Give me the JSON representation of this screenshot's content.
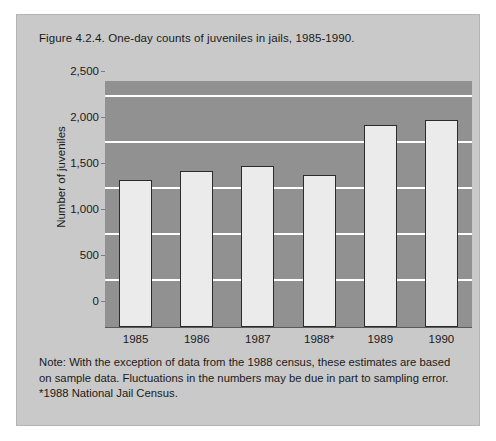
{
  "figure": {
    "title": "Figure 4.2.4. One-day counts of juveniles in jails, 1985-1990.",
    "note": "Note: With the exception of data from the 1988 census, these estimates are based on sample data. Fluctuations in the numbers may be due in part to sampling error. *1988 National Jail Census."
  },
  "colors": {
    "page_background": "#ffffff",
    "card_background": "#c9c9c9",
    "plot_background": "#919191",
    "gridline": "#ffffff",
    "bar_fill": "#ebebeb",
    "bar_outline": "#2b2b2b",
    "text": "#1a1a1a"
  },
  "chart_data": {
    "type": "bar",
    "title": "Figure 4.2.4. One-day counts of juveniles in jails, 1985-1990.",
    "xlabel": "",
    "ylabel": "Number of juveniles",
    "categories": [
      "1985",
      "1986",
      "1987",
      "1988*",
      "1989",
      "1990"
    ],
    "values": [
      1600,
      1700,
      1750,
      1650,
      2200,
      2250
    ],
    "ylim": [
      0,
      2500
    ],
    "yticks": [
      0,
      500,
      1000,
      1500,
      2000,
      2500
    ],
    "ytick_labels": [
      "0",
      "500",
      "1,000",
      "1,500",
      "2,000",
      "2,500"
    ],
    "grid": true,
    "legend": false,
    "annotations": [
      "*1988 National Jail Census."
    ]
  }
}
